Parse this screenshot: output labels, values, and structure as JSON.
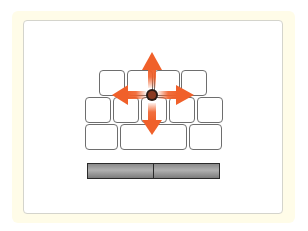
{
  "figure": {
    "caption_partial": "· · · · · · ·",
    "colors": {
      "frame_background": "#fffce8",
      "panel_background": "#ffffff",
      "key_border": "#6e6e6e",
      "arrow_color": "#f0602a",
      "trackpoint_color": "#8a3a22",
      "button_color": "#9a9a9a"
    },
    "keyboard_rows": [
      {
        "row": 1,
        "keys": 4
      },
      {
        "row": 2,
        "keys": 5
      },
      {
        "row": 3,
        "keys": 3
      }
    ],
    "arrows": [
      "up",
      "down",
      "left",
      "right"
    ],
    "mouse_buttons": [
      {
        "name": "left-click-button"
      },
      {
        "name": "right-click-button"
      }
    ]
  }
}
